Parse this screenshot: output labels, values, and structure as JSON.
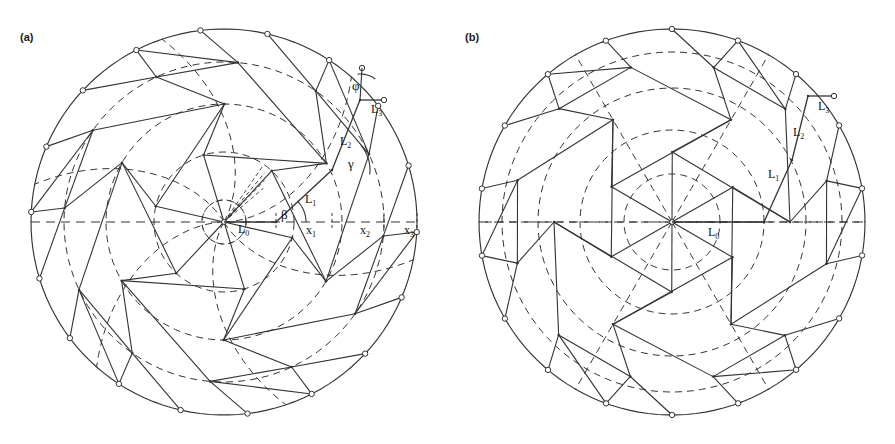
{
  "figure": {
    "type": "technical-diagram",
    "background_color": "#ffffff",
    "line_color": "#333333",
    "node_fill": "#ffffff",
    "node_stroke": "#333333"
  },
  "panels": [
    {
      "id": "a",
      "label": "(a)",
      "center": {
        "x": 224,
        "y": 222
      },
      "outer_radius": 193,
      "ring_radii": [
        22,
        70,
        118,
        160,
        193
      ],
      "n_sectors": 6,
      "twist": true,
      "labels": {
        "L0": "L",
        "L0_sub": "0",
        "L1": "L",
        "L1_sub": "1",
        "L2": "L",
        "L2_sub": "2",
        "L3": "L",
        "L3_sub": "3",
        "x1": "x",
        "x1_sub": "1",
        "x2": "x",
        "x2_sub": "2",
        "x3": "x",
        "x3_sub": "3",
        "beta": "β",
        "gamma": "γ",
        "phi": "φ"
      },
      "label_positions": {
        "L0": {
          "x": 238,
          "y": 233
        },
        "L1": {
          "x": 305,
          "y": 203
        },
        "L2": {
          "x": 340,
          "y": 145
        },
        "L3": {
          "x": 371,
          "y": 113
        },
        "x1": {
          "x": 306,
          "y": 234
        },
        "x2": {
          "x": 360,
          "y": 234
        },
        "x3": {
          "x": 404,
          "y": 234
        },
        "beta": {
          "x": 281,
          "y": 219
        },
        "gamma": {
          "x": 348,
          "y": 168
        },
        "phi": {
          "x": 352,
          "y": 90
        }
      }
    },
    {
      "id": "b",
      "label": "(b)",
      "center": {
        "x": 224,
        "y": 222
      },
      "outer_radius": 193,
      "ring_radii": [
        0,
        70,
        118,
        160,
        193
      ],
      "n_sectors": 6,
      "twist": false,
      "labels": {
        "L0": "L",
        "L0_sub": "0",
        "L1": "L",
        "L1_sub": "1",
        "L2": "L",
        "L2_sub": "2",
        "L3": "L",
        "L3_sub": "3"
      },
      "label_positions": {
        "L0": {
          "x": 260,
          "y": 236
        },
        "L1": {
          "x": 320,
          "y": 178
        },
        "L2": {
          "x": 345,
          "y": 136
        },
        "L3": {
          "x": 370,
          "y": 110
        }
      }
    }
  ]
}
